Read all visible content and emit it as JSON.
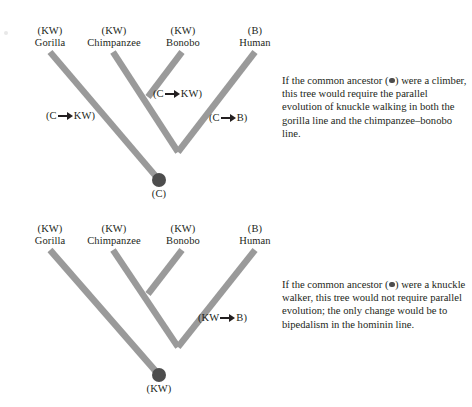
{
  "figure": {
    "branch_color": "#9a9a9a",
    "node_color": "#4d4d4d",
    "text_color": "#231f20",
    "background_color": "#ffffff"
  },
  "trees": [
    {
      "id": "top-tree",
      "root_label": "(C)",
      "tips": [
        {
          "state": "(KW)",
          "taxon": "Gorilla"
        },
        {
          "state": "(KW)",
          "taxon": "Chimpanzee"
        },
        {
          "state": "(KW)",
          "taxon": "Bonobo"
        },
        {
          "state": "(B)",
          "taxon": "Human"
        }
      ],
      "branch_labels": [
        {
          "id": "gorilla-change",
          "from": "C",
          "to": "KW",
          "text": "(C → KW)"
        },
        {
          "id": "chimp-bonobo-change",
          "from": "C",
          "to": "KW",
          "text": "(C → KW)"
        },
        {
          "id": "human-change",
          "from": "C",
          "to": "B",
          "text": "(C → B)"
        }
      ],
      "caption": {
        "before_dot": "If the common ancestor (",
        "after_dot": ") were a climber, this tree would require the parallel evolution of knuckle walking in both the gorilla line and the chimpanzee–bonobo line."
      }
    },
    {
      "id": "bottom-tree",
      "root_label": "(KW)",
      "tips": [
        {
          "state": "(KW)",
          "taxon": "Gorilla"
        },
        {
          "state": "(KW)",
          "taxon": "Chimpanzee"
        },
        {
          "state": "(KW)",
          "taxon": "Bonobo"
        },
        {
          "state": "(B)",
          "taxon": "Human"
        }
      ],
      "branch_labels": [
        {
          "id": "human-change",
          "from": "KW",
          "to": "B",
          "text": "(KW → B)"
        }
      ],
      "caption": {
        "before_dot": "If the common ancestor (",
        "after_dot": ") were a knuckle walker, this tree would not require parallel evolution; the only change would be to bipedalism in the hominin line."
      }
    }
  ],
  "legend_keys": {
    "C": "climber",
    "KW": "knuckle walker",
    "B": "bipedal"
  }
}
